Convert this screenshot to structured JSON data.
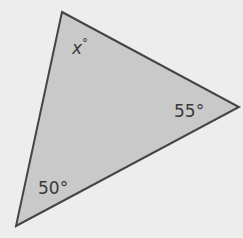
{
  "diagram": {
    "type": "triangle",
    "fill_color": "#c9c9c9",
    "stroke_color": "#444444",
    "background_color": "#ededed",
    "vertices": {
      "top": [
        62,
        12
      ],
      "right": [
        239,
        107
      ],
      "bottom_left": [
        16,
        226
      ]
    },
    "angles": {
      "top": {
        "label": "x°",
        "var": "x",
        "deg": "°"
      },
      "right": {
        "label": "55°"
      },
      "bottom_left": {
        "label": "50°"
      }
    }
  }
}
